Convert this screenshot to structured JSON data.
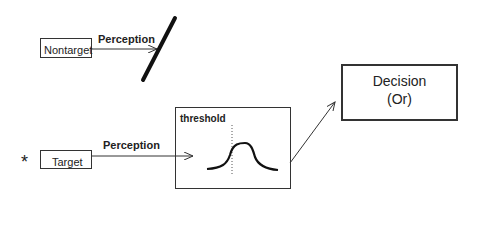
{
  "nontarget": {
    "label": "Nontarget",
    "arrow_label": "Perception"
  },
  "target": {
    "marker": "*",
    "label": "Target",
    "arrow_label": "Perception"
  },
  "threshold_box": {
    "label": "threshold"
  },
  "decision_box": {
    "line1": "Decision",
    "line2": "(Or)"
  }
}
